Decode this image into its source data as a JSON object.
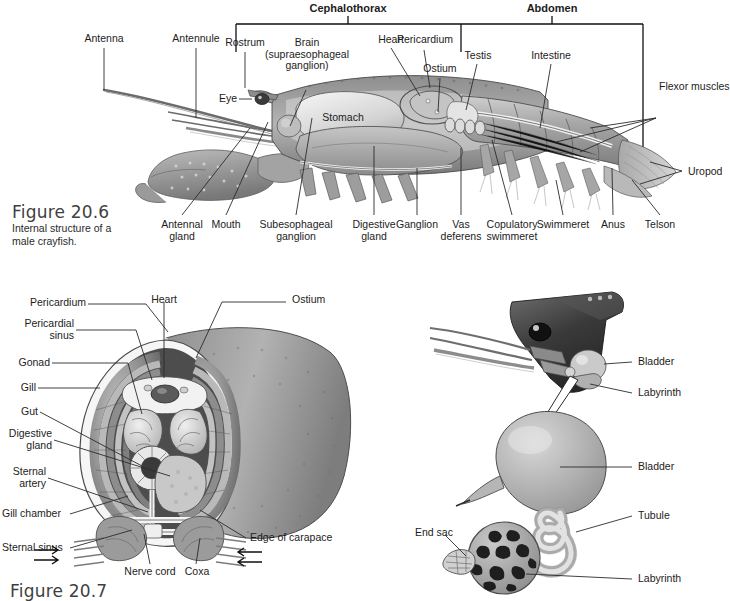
{
  "page": {
    "background": "#ffffff",
    "line_color": "#2b2b2b"
  },
  "figure_206": {
    "caption_title": "Figure 20.6",
    "caption_body": "Internal structure of a\nmale crayfish.",
    "brackets": [
      {
        "label": "Cephalothorax"
      },
      {
        "label": "Abdomen"
      }
    ],
    "labels_top": [
      {
        "text": "Antenna"
      },
      {
        "text": "Antennule"
      },
      {
        "text": "Rostrum"
      },
      {
        "text": "Brain\n(supraesophageal\nganglion)"
      },
      {
        "text": "Heart"
      },
      {
        "text": "Pericardium"
      },
      {
        "text": "Ostium"
      },
      {
        "text": "Testis"
      },
      {
        "text": "Intestine"
      },
      {
        "text": "Flexor muscles"
      },
      {
        "text": "Eye"
      },
      {
        "text": "Stomach"
      },
      {
        "text": "Uropod"
      }
    ],
    "labels_bottom": [
      {
        "text": "Antennal\ngland"
      },
      {
        "text": "Mouth"
      },
      {
        "text": "Subesophageal\nganglion"
      },
      {
        "text": "Digestive\ngland"
      },
      {
        "text": "Ganglion"
      },
      {
        "text": "Vas\ndeferens"
      },
      {
        "text": "Copulatory\nswimmeret"
      },
      {
        "text": "Swimmeret"
      },
      {
        "text": "Anus"
      },
      {
        "text": "Telson"
      }
    ]
  },
  "figure_207": {
    "caption_title": "Figure 20.7",
    "labels_left": [
      {
        "text": "Pericardial\nsinus"
      },
      {
        "text": "Gonad"
      },
      {
        "text": "Gill"
      },
      {
        "text": "Gut"
      },
      {
        "text": "Digestive\ngland"
      },
      {
        "text": "Sternal\nartery"
      },
      {
        "text": "Gill chamber"
      },
      {
        "text": "Sternal sinus"
      }
    ],
    "labels_top": [
      {
        "text": "Pericardium"
      },
      {
        "text": "Heart"
      },
      {
        "text": "Ostium"
      }
    ],
    "labels_bottom": [
      {
        "text": "Nerve cord"
      },
      {
        "text": "Coxa"
      },
      {
        "text": "Edge of carapace"
      }
    ]
  },
  "figure_gland": {
    "labels": [
      {
        "text": "Bladder"
      },
      {
        "text": "Labyrinth"
      },
      {
        "text": "Bladder"
      },
      {
        "text": "Tubule"
      },
      {
        "text": "End sac"
      },
      {
        "text": "Labyrinth"
      }
    ]
  }
}
